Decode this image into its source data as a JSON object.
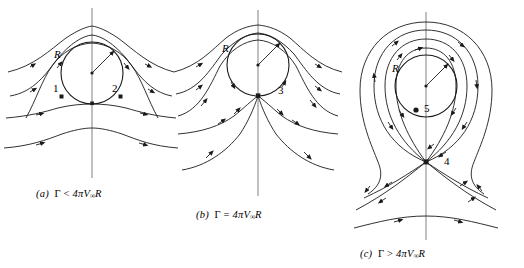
{
  "figure": {
    "background_color": "#ffffff",
    "stream_color": "#1a1a1a",
    "axis_color": "#8c8c8c",
    "cylinder_color": "#1a1a1a"
  },
  "panels": [
    {
      "id": "a",
      "panel_label": "(a)",
      "caption_symbol": "Γ",
      "caption_relation": "<",
      "caption_expression": "4πV",
      "caption_subscript": "∞",
      "caption_suffix": "R",
      "caption_full": "(a)  Γ < 4πV∞R",
      "radius_label": "R",
      "stagnation_points": [
        {
          "label": "1",
          "position": "lower-left-on-cylinder"
        },
        {
          "label": "2",
          "position": "lower-right-on-cylinder"
        }
      ],
      "description": "Two stagnation points on the cylinder surface below the horizontal centerline"
    },
    {
      "id": "b",
      "panel_label": "(b)",
      "caption_symbol": "Γ",
      "caption_relation": "=",
      "caption_expression": "4πV",
      "caption_subscript": "∞",
      "caption_suffix": "R",
      "caption_full": "(b)  Γ = 4πV∞R",
      "radius_label": "R",
      "stagnation_points": [
        {
          "label": "3",
          "position": "bottom-of-cylinder"
        }
      ],
      "description": "Single stagnation point at the bottom of the cylinder"
    },
    {
      "id": "c",
      "panel_label": "(c)",
      "caption_symbol": "Γ",
      "caption_relation": ">",
      "caption_expression": "4πV",
      "caption_subscript": "∞",
      "caption_suffix": "R",
      "caption_full": "(c)  Γ > 4πV∞R",
      "radius_label": "R",
      "stagnation_points": [
        {
          "label": "4",
          "position": "below-cylinder-in-flow"
        },
        {
          "label": "5",
          "position": "inside-cylinder-center-region"
        }
      ],
      "description": "Stagnation point displaced below the cylinder, with closed streamline loops encircling the body"
    }
  ]
}
